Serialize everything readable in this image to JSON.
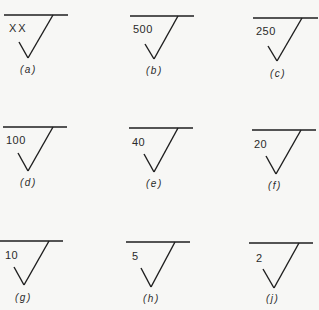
{
  "figure": {
    "symbols": [
      {
        "value": "XX",
        "caption": "(a)"
      },
      {
        "value": "500",
        "caption": "(b)"
      },
      {
        "value": "250",
        "caption": "(c)"
      },
      {
        "value": "100",
        "caption": "(d)"
      },
      {
        "value": "40",
        "caption": "(e)"
      },
      {
        "value": "20",
        "caption": "(f)"
      },
      {
        "value": "10",
        "caption": "(g)"
      },
      {
        "value": "5",
        "caption": "(h)"
      },
      {
        "value": "2",
        "caption": "(j)"
      }
    ],
    "line_color": "#1e1e1e",
    "background": "#f7f7f5"
  }
}
